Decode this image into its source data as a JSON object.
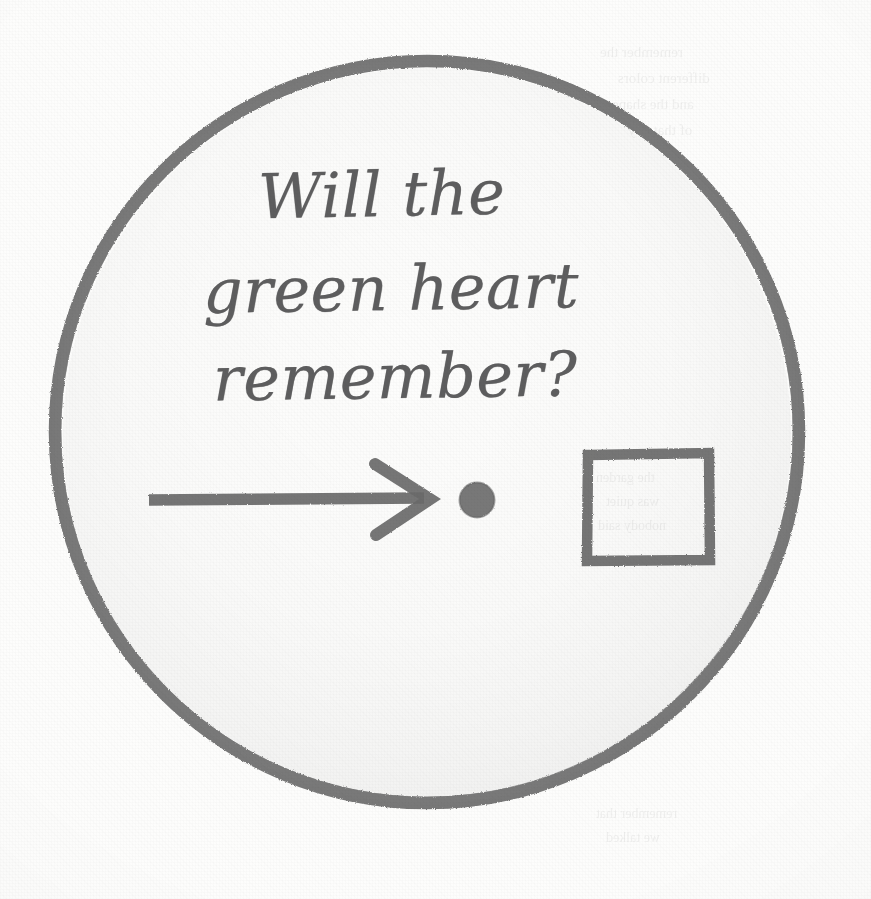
{
  "page": {
    "width": 871,
    "height": 899,
    "background_color": "#fdfdfc",
    "medium": "scanned pencil drawing on paper"
  },
  "note": {
    "handwritten_text": {
      "full": "Will the green heart remember?",
      "lines": [
        "Will the",
        "green heart",
        "remember?"
      ],
      "ink_color": "#5e5e5f",
      "style": "cursive handwriting"
    },
    "circle": {
      "label": "hand-drawn circle outline",
      "center_x": 427,
      "center_y": 432,
      "radius": 371,
      "stroke_color": "#6e6e6e",
      "stroke_width": 11,
      "fill": "none"
    },
    "shapes": [
      {
        "name": "arrow",
        "direction": "right",
        "start_x": 148,
        "end_x": 430,
        "y": 499,
        "stroke_color": "#6a6a6a",
        "stroke_width": 11
      },
      {
        "name": "dot",
        "center_x": 477,
        "center_y": 500,
        "radius": 17,
        "fill_color": "#6a6a6a"
      },
      {
        "name": "square",
        "left": 586,
        "top": 453,
        "size": 122,
        "stroke_color": "#6a6a6a",
        "stroke_width": 10,
        "fill": "none"
      }
    ]
  },
  "bleed_through": {
    "description": "faint mirrored text showing through from the reverse side of the page",
    "fragments": [
      {
        "text": "remember the",
        "x": 600,
        "y": 44,
        "size": 15
      },
      {
        "text": "different colors",
        "x": 618,
        "y": 70,
        "size": 15
      },
      {
        "text": "and the shape",
        "x": 612,
        "y": 96,
        "size": 15
      },
      {
        "text": "of that day",
        "x": 628,
        "y": 122,
        "size": 15
      },
      {
        "text": "the garden",
        "x": 596,
        "y": 470,
        "size": 14
      },
      {
        "text": "was quiet",
        "x": 606,
        "y": 494,
        "size": 14
      },
      {
        "text": "nobody said",
        "x": 598,
        "y": 518,
        "size": 14
      },
      {
        "text": "remember that",
        "x": 596,
        "y": 806,
        "size": 14
      },
      {
        "text": "we talked",
        "x": 606,
        "y": 830,
        "size": 14
      }
    ]
  }
}
